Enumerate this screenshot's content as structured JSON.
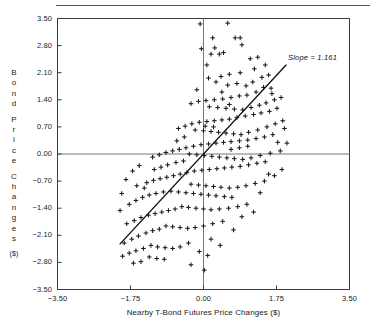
{
  "chart_data": {
    "type": "scatter",
    "title": "",
    "xlabel": "Nearby T-Bond Futures Price Changes ($)",
    "ylabel": "Bond Price Changes ($)",
    "ylabel_letters": [
      "B",
      "o",
      "n",
      "d",
      "P",
      "r",
      "i",
      "c",
      "e",
      "C",
      "h",
      "a",
      "n",
      "g",
      "e",
      "s"
    ],
    "ylabel_unit": "($)",
    "xlim": [
      -3.5,
      3.5
    ],
    "ylim": [
      -3.5,
      3.5
    ],
    "xticks": [
      "-3.50",
      "-1.75",
      "0.00",
      "1.75",
      "3.50"
    ],
    "xtick_values": [
      -3.5,
      -1.75,
      0,
      1.75,
      3.5
    ],
    "yticks": [
      "3.50",
      "2.80",
      "2.10",
      "1.40",
      "0.70",
      "0.00",
      "-0.70",
      "-1.40",
      "-2.10",
      "-2.80",
      "-3.50"
    ],
    "ytick_values": [
      3.5,
      2.8,
      2.1,
      1.4,
      0.7,
      0,
      -0.7,
      -1.4,
      -2.1,
      -2.8,
      -3.5
    ],
    "grid": false,
    "legend": null,
    "marker": "plus",
    "marker_color": "#1a1a1a",
    "zero_lines": true,
    "zero_line_color": "#777777",
    "frame_color": "#3a3a3a",
    "annotations": [
      {
        "text": "Slope = 1.161",
        "x": 2.05,
        "y": 2.35,
        "style": "italic"
      }
    ],
    "fit_line": {
      "slope": 1.161,
      "intercept": 0.0,
      "x_start": -2.0,
      "x_end": 1.98,
      "color": "#111111"
    },
    "points": [
      [
        -0.08,
        3.36
      ],
      [
        0.58,
        3.38
      ],
      [
        0.22,
        3.0
      ],
      [
        0.76,
        3.0
      ],
      [
        0.88,
        3.0
      ],
      [
        -0.05,
        2.72
      ],
      [
        0.27,
        2.74
      ],
      [
        0.48,
        2.62
      ],
      [
        0.18,
        2.58
      ],
      [
        0.38,
        2.58
      ],
      [
        0.92,
        2.82
      ],
      [
        1.12,
        2.46
      ],
      [
        1.3,
        2.5
      ],
      [
        1.22,
        2.2
      ],
      [
        0.88,
        2.1
      ],
      [
        0.62,
        2.06
      ],
      [
        0.42,
        2.0
      ],
      [
        0.12,
        1.96
      ],
      [
        0.3,
        1.86
      ],
      [
        0.58,
        1.78
      ],
      [
        0.8,
        1.82
      ],
      [
        1.02,
        1.76
      ],
      [
        1.18,
        1.86
      ],
      [
        1.4,
        1.98
      ],
      [
        1.56,
        2.04
      ],
      [
        1.44,
        1.72
      ],
      [
        1.62,
        1.7
      ],
      [
        1.26,
        1.6
      ],
      [
        1.04,
        1.52
      ],
      [
        0.86,
        1.5
      ],
      [
        0.66,
        1.46
      ],
      [
        0.46,
        1.42
      ],
      [
        0.26,
        1.4
      ],
      [
        0.06,
        1.38
      ],
      [
        -0.12,
        1.36
      ],
      [
        -0.3,
        1.3
      ],
      [
        0.14,
        1.22
      ],
      [
        0.34,
        1.2
      ],
      [
        0.54,
        1.18
      ],
      [
        0.74,
        1.16
      ],
      [
        0.94,
        1.14
      ],
      [
        1.14,
        1.2
      ],
      [
        1.34,
        1.26
      ],
      [
        1.5,
        1.32
      ],
      [
        1.7,
        1.4
      ],
      [
        1.86,
        1.46
      ],
      [
        1.76,
        1.18
      ],
      [
        1.58,
        1.1
      ],
      [
        1.38,
        1.06
      ],
      [
        1.2,
        1.02
      ],
      [
        1.0,
        0.98
      ],
      [
        0.8,
        0.94
      ],
      [
        0.62,
        0.9
      ],
      [
        0.44,
        0.88
      ],
      [
        0.26,
        0.86
      ],
      [
        0.08,
        0.84
      ],
      [
        -0.1,
        0.82
      ],
      [
        -0.28,
        0.78
      ],
      [
        -0.44,
        0.72
      ],
      [
        -0.6,
        0.66
      ],
      [
        -0.2,
        0.62
      ],
      [
        0.0,
        0.6
      ],
      [
        0.18,
        0.58
      ],
      [
        0.36,
        0.56
      ],
      [
        0.54,
        0.54
      ],
      [
        0.72,
        0.52
      ],
      [
        0.9,
        0.5
      ],
      [
        1.08,
        0.56
      ],
      [
        1.3,
        0.62
      ],
      [
        1.52,
        0.7
      ],
      [
        1.72,
        0.78
      ],
      [
        1.9,
        0.86
      ],
      [
        1.66,
        0.5
      ],
      [
        1.46,
        0.44
      ],
      [
        1.26,
        0.4
      ],
      [
        1.06,
        0.36
      ],
      [
        0.86,
        0.34
      ],
      [
        0.66,
        0.32
      ],
      [
        0.48,
        0.3
      ],
      [
        0.3,
        0.28
      ],
      [
        0.12,
        0.26
      ],
      [
        -0.06,
        0.24
      ],
      [
        -0.24,
        0.2
      ],
      [
        -0.42,
        0.16
      ],
      [
        -0.58,
        0.12
      ],
      [
        -0.74,
        0.08
      ],
      [
        -0.9,
        0.04
      ],
      [
        -1.06,
        -0.02
      ],
      [
        -1.22,
        -0.08
      ],
      [
        -0.34,
        0.0
      ],
      [
        -0.16,
        -0.02
      ],
      [
        0.02,
        -0.04
      ],
      [
        0.2,
        -0.06
      ],
      [
        0.38,
        -0.08
      ],
      [
        0.56,
        -0.1
      ],
      [
        0.74,
        -0.12
      ],
      [
        0.94,
        -0.14
      ],
      [
        1.14,
        -0.1
      ],
      [
        1.36,
        -0.04
      ],
      [
        1.6,
        0.02
      ],
      [
        1.84,
        0.08
      ],
      [
        1.48,
        -0.2
      ],
      [
        1.28,
        -0.24
      ],
      [
        1.08,
        -0.28
      ],
      [
        0.88,
        -0.32
      ],
      [
        0.68,
        -0.34
      ],
      [
        0.5,
        -0.36
      ],
      [
        0.32,
        -0.38
      ],
      [
        0.14,
        -0.4
      ],
      [
        -0.04,
        -0.42
      ],
      [
        -0.22,
        -0.44
      ],
      [
        -0.4,
        -0.48
      ],
      [
        -0.56,
        -0.52
      ],
      [
        -0.72,
        -0.56
      ],
      [
        -0.88,
        -0.6
      ],
      [
        -1.04,
        -0.64
      ],
      [
        -1.2,
        -0.68
      ],
      [
        -1.36,
        -0.74
      ],
      [
        -0.3,
        -0.78
      ],
      [
        -0.12,
        -0.8
      ],
      [
        0.06,
        -0.82
      ],
      [
        0.24,
        -0.84
      ],
      [
        0.42,
        -0.86
      ],
      [
        0.62,
        -0.88
      ],
      [
        0.82,
        -0.86
      ],
      [
        1.02,
        -0.82
      ],
      [
        1.24,
        -0.76
      ],
      [
        1.46,
        -0.7
      ],
      [
        0.5,
        -1.1
      ],
      [
        0.68,
        -1.12
      ],
      [
        0.3,
        -1.08
      ],
      [
        0.12,
        -1.06
      ],
      [
        -0.06,
        -1.04
      ],
      [
        -0.24,
        -1.02
      ],
      [
        -0.42,
        -1.0
      ],
      [
        -0.6,
        -0.98
      ],
      [
        -0.78,
        -0.96
      ],
      [
        -0.96,
        -0.98
      ],
      [
        -1.14,
        -1.02
      ],
      [
        -1.3,
        -1.06
      ],
      [
        -1.46,
        -1.12
      ],
      [
        -1.62,
        -1.2
      ],
      [
        -1.78,
        -1.3
      ],
      [
        -0.52,
        -1.36
      ],
      [
        -0.36,
        -1.38
      ],
      [
        -0.18,
        -1.4
      ],
      [
        0.0,
        -1.42
      ],
      [
        0.18,
        -1.44
      ],
      [
        0.38,
        -1.42
      ],
      [
        0.6,
        -1.4
      ],
      [
        0.82,
        -1.36
      ],
      [
        1.04,
        -1.3
      ],
      [
        -0.68,
        -1.42
      ],
      [
        -0.84,
        -1.46
      ],
      [
        -1.0,
        -1.5
      ],
      [
        -1.16,
        -1.54
      ],
      [
        -1.32,
        -1.58
      ],
      [
        -1.5,
        -1.64
      ],
      [
        -1.66,
        -1.72
      ],
      [
        -1.84,
        -1.8
      ],
      [
        -0.9,
        -1.86
      ],
      [
        -0.74,
        -1.88
      ],
      [
        -0.56,
        -1.9
      ],
      [
        -0.38,
        -1.92
      ],
      [
        -0.2,
        -1.9
      ],
      [
        0.0,
        -1.86
      ],
      [
        0.22,
        -1.8
      ],
      [
        0.46,
        -1.74
      ],
      [
        -1.06,
        -1.94
      ],
      [
        -1.22,
        -1.98
      ],
      [
        -1.38,
        -2.04
      ],
      [
        -1.56,
        -2.12
      ],
      [
        -1.72,
        -2.2
      ],
      [
        -1.9,
        -2.3
      ],
      [
        -1.26,
        -2.36
      ],
      [
        -1.1,
        -2.4
      ],
      [
        -0.92,
        -2.42
      ],
      [
        -0.74,
        -2.44
      ],
      [
        -0.56,
        -2.4
      ],
      [
        -0.36,
        -2.3
      ],
      [
        -1.44,
        -2.44
      ],
      [
        -1.62,
        -2.5
      ],
      [
        -1.78,
        -2.56
      ],
      [
        -1.94,
        -2.64
      ],
      [
        -1.3,
        -2.66
      ],
      [
        -1.12,
        -2.7
      ],
      [
        -0.94,
        -2.72
      ],
      [
        -1.5,
        -2.78
      ],
      [
        -1.68,
        -2.82
      ],
      [
        0.18,
        -2.2
      ],
      [
        0.4,
        -2.36
      ],
      [
        -0.1,
        -2.52
      ],
      [
        0.1,
        -2.62
      ],
      [
        -0.3,
        -2.86
      ],
      [
        0.02,
        -3.0
      ],
      [
        1.36,
        -1.0
      ],
      [
        1.7,
        -0.56
      ],
      [
        1.88,
        -0.4
      ],
      [
        2.0,
        0.28
      ],
      [
        1.94,
        0.66
      ],
      [
        -2.0,
        -1.46
      ],
      [
        -1.96,
        -1.02
      ],
      [
        -1.86,
        -0.66
      ],
      [
        -1.7,
        -0.44
      ],
      [
        -1.54,
        -0.3
      ],
      [
        0.66,
        0.12
      ],
      [
        0.86,
        0.16
      ],
      [
        1.06,
        0.2
      ],
      [
        -0.48,
        -0.18
      ],
      [
        -0.66,
        -0.22
      ],
      [
        0.44,
        1.6
      ],
      [
        0.62,
        1.28
      ],
      [
        -0.46,
        0.44
      ],
      [
        -0.64,
        0.34
      ],
      [
        1.64,
        1.56
      ],
      [
        -0.86,
        -0.28
      ],
      [
        -1.02,
        -0.34
      ],
      [
        -1.18,
        -0.4
      ],
      [
        0.24,
        0.7
      ],
      [
        0.04,
        0.72
      ],
      [
        1.78,
        0.3
      ],
      [
        1.56,
        -0.52
      ],
      [
        1.2,
        -1.5
      ],
      [
        0.92,
        -1.62
      ],
      [
        0.72,
        -1.96
      ],
      [
        -1.6,
        -0.82
      ],
      [
        -1.42,
        -0.88
      ],
      [
        -0.16,
        1.66
      ],
      [
        1.48,
        2.3
      ],
      [
        0.08,
        2.3
      ]
    ]
  }
}
